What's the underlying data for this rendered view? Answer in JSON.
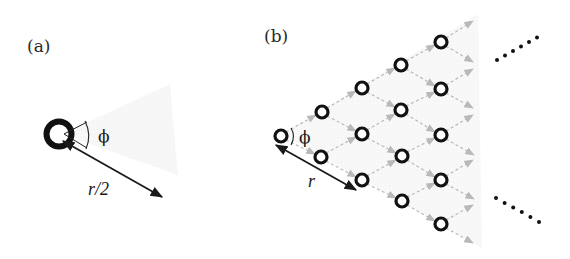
{
  "figure": {
    "panels": [
      {
        "id": "a",
        "label": "(a)",
        "description": "Single node with emission cone of angle phi and range r/2",
        "angle_label": "ϕ",
        "range_label": "r/2",
        "colors": {
          "node": "#111111",
          "cone": "#f3f3f3",
          "arrow": "#1a1a1a"
        }
      },
      {
        "id": "b",
        "label": "(b)",
        "description": "Triangular lattice of nodes connected by dashed gray arrows spreading rightward",
        "angle_label": "ϕ",
        "range_label": "r",
        "columns": [
          {
            "nodes": 1
          },
          {
            "nodes": 2
          },
          {
            "nodes": 3
          },
          {
            "nodes": 4
          },
          {
            "nodes": 5
          }
        ],
        "ellipsis": [
          "......",
          "......"
        ],
        "colors": {
          "node": "#111111",
          "lattice_arrow": "#b9b9b9",
          "background": "#f5f5f5"
        }
      }
    ]
  }
}
